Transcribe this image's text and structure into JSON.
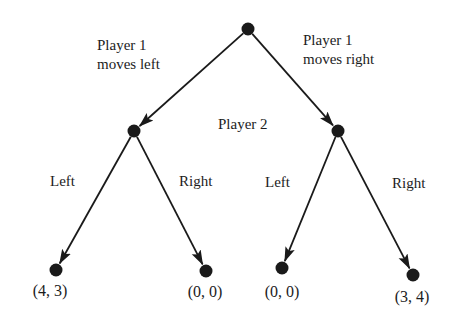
{
  "diagram": {
    "type": "extensive-form game tree",
    "colors": {
      "edge": "#1a1a1a",
      "node": "#1a1a1a",
      "text": "#1c1c1c",
      "background": "#ffffff"
    },
    "nodes": [
      {
        "id": "root",
        "player": "Player 1",
        "x": 248,
        "y": 29,
        "r": 6.5
      },
      {
        "id": "p2_left",
        "player": "Player 2",
        "x": 134,
        "y": 131,
        "r": 6.5
      },
      {
        "id": "p2_right",
        "player": "Player 2",
        "x": 338,
        "y": 131,
        "r": 6.5
      },
      {
        "id": "leaf_ll",
        "x": 56,
        "y": 270,
        "r": 6.5
      },
      {
        "id": "leaf_lr",
        "x": 206,
        "y": 271,
        "r": 6.5
      },
      {
        "id": "leaf_rl",
        "x": 282,
        "y": 268,
        "r": 6.5
      },
      {
        "id": "leaf_rr",
        "x": 413,
        "y": 275,
        "r": 6.5
      }
    ],
    "edges": [
      {
        "from": "root",
        "to": "p2_left",
        "label": "Player 1 moves left"
      },
      {
        "from": "root",
        "to": "p2_right",
        "label": "Player 1 moves right"
      },
      {
        "from": "p2_left",
        "to": "leaf_ll",
        "label": "Left"
      },
      {
        "from": "p2_left",
        "to": "leaf_lr",
        "label": "Right"
      },
      {
        "from": "p2_right",
        "to": "leaf_rl",
        "label": "Left"
      },
      {
        "from": "p2_right",
        "to": "leaf_rr",
        "label": "Right"
      }
    ],
    "labels": {
      "p1_left_line1": "Player 1",
      "p1_left_line2": "moves left",
      "p1_right_line1": "Player 1",
      "p1_right_line2": "moves right",
      "player2": "Player 2",
      "left_branch_left": "Left",
      "left_branch_right": "Right",
      "right_branch_left": "Left",
      "right_branch_right": "Right"
    },
    "payoffs": [
      {
        "leaf": "leaf_ll",
        "text": "(4, 3)",
        "x": 50,
        "y": 282
      },
      {
        "leaf": "leaf_lr",
        "text": "(0, 0)",
        "x": 205,
        "y": 283
      },
      {
        "leaf": "leaf_rl",
        "text": "(0, 0)",
        "x": 282,
        "y": 283
      },
      {
        "leaf": "leaf_rr",
        "text": "(3, 4)",
        "x": 412,
        "y": 288
      }
    ]
  }
}
